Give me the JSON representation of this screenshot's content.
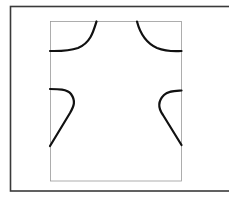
{
  "diagram": {
    "title": "",
    "outer_frame": {
      "x": 10.5,
      "y": 6.5,
      "width": 222,
      "height": 184.5,
      "stroke": "#3a3a3a",
      "stroke_width": 1.6
    },
    "inner_rect": {
      "x": 50.5,
      "y": 21.5,
      "width": 131,
      "height": 159.5,
      "stroke": "#9a9a9a",
      "stroke_width": 0.8
    },
    "curves": [
      {
        "name": "top-left-curve",
        "d": "M 96.5 21.5 C 93 33, 90 43, 78 48 C 68 51.5, 58 51, 50 51"
      },
      {
        "name": "top-right-curve",
        "d": "M 137 21.5 C 140 33, 146 43, 157 48 C 166 51.5, 174 51.5, 181.5 51"
      },
      {
        "name": "left-middle-curve",
        "d": "M 50 89 C 58 89, 67 89, 71 94 C 76 101, 74 106, 70 113 L 50 146"
      },
      {
        "name": "right-middle-curve",
        "d": "M 181.5 90.5 C 174 91, 168 91, 164 95 C 158 101, 158 108, 163 115 L 181.5 145"
      }
    ],
    "curve_stroke": "#111111",
    "curve_stroke_width": 2.2
  }
}
